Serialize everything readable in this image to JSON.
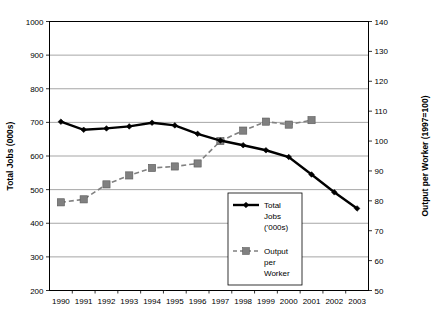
{
  "chart_data": {
    "type": "line",
    "title": "",
    "xlabel": "",
    "ylabel": "Total Jobs (000s)",
    "y2label": "Output per Worker (1997=100)",
    "categories": [
      "1990",
      "1991",
      "1992",
      "1993",
      "1994",
      "1995",
      "1996",
      "1997",
      "1998",
      "1999",
      "2000",
      "2001",
      "2002",
      "2003"
    ],
    "ylim": [
      200,
      1000
    ],
    "y2lim": [
      50,
      140
    ],
    "yticks": [
      200,
      300,
      400,
      500,
      600,
      700,
      800,
      900,
      1000
    ],
    "y2ticks": [
      50,
      60,
      70,
      80,
      90,
      100,
      110,
      120,
      130,
      140
    ],
    "grid": true,
    "legend_position": "inside-lower-right",
    "series": [
      {
        "name": "Total Jobs ('000s)",
        "axis": "left",
        "color": "#000000",
        "marker": "diamond",
        "line_style": "solid",
        "values": [
          702,
          678,
          682,
          688,
          699,
          691,
          666,
          646,
          632,
          617,
          597,
          545,
          492,
          444
        ]
      },
      {
        "name": "Output per Worker",
        "axis": "right",
        "color": "#808080",
        "marker": "square",
        "line_style": "dashed",
        "values": [
          79.5,
          80.5,
          85.5,
          88.5,
          91.0,
          91.5,
          92.5,
          100.0,
          103.5,
          106.5,
          105.5,
          107.0,
          null,
          null
        ]
      }
    ],
    "legend": [
      {
        "label_lines": [
          "Total",
          "Jobs",
          "('000s)"
        ],
        "marker": "diamond",
        "color": "#000000",
        "line_style": "solid"
      },
      {
        "label_lines": [
          "Output",
          "per",
          "Worker"
        ],
        "marker": "square",
        "color": "#808080",
        "line_style": "dashed"
      }
    ]
  }
}
